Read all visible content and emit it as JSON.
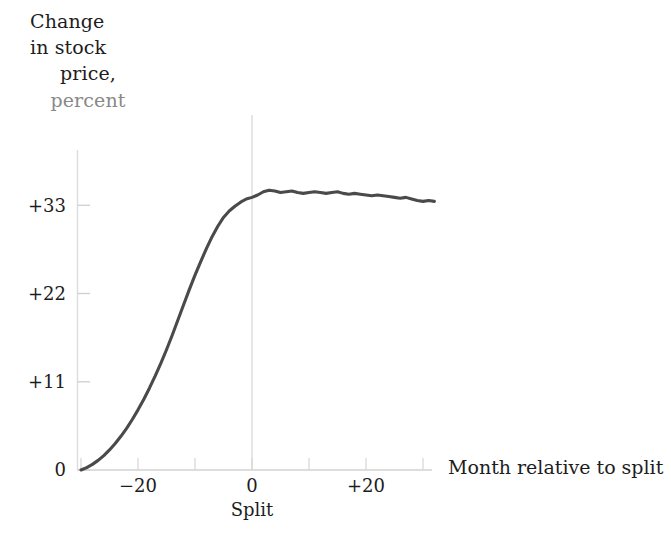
{
  "figure": {
    "name": "stock-split-residual-returns-chart",
    "background_color": "#ffffff",
    "curve_color": "#4a4a4a",
    "axis_color": "#d7d7d7",
    "text_color": "#1d1d1d"
  },
  "y_axis_caption": {
    "line1": "Change",
    "line2": "in stock",
    "line3": "price,",
    "line4": "percent"
  },
  "x_axis_caption": "Month relative to split",
  "split_marker_label": "Split",
  "chart_data": {
    "type": "line",
    "title": "",
    "subtitle": "",
    "xlabel": "Month relative to split",
    "ylabel": "Change in stock price, percent",
    "xlim": [
      -30,
      32
    ],
    "ylim": [
      0,
      38
    ],
    "grid": false,
    "legend": null,
    "annotations": [
      {
        "text": "Split",
        "x": 0,
        "y": 0,
        "type": "vertical-reference-line"
      }
    ],
    "x_ticks": [
      -30,
      -20,
      -10,
      0,
      10,
      20,
      30
    ],
    "x_tick_labels": [
      "",
      "−20",
      "",
      "0",
      "",
      "+20",
      ""
    ],
    "y_ticks": [
      0,
      11,
      22,
      33
    ],
    "y_tick_labels": [
      "0",
      "+11",
      "+22",
      "+33"
    ],
    "series": [
      {
        "name": "Cumulative average residual, percent",
        "x": [
          -30,
          -29,
          -28,
          -27,
          -26,
          -25,
          -24,
          -23,
          -22,
          -21,
          -20,
          -19,
          -18,
          -17,
          -16,
          -15,
          -14,
          -13,
          -12,
          -11,
          -10,
          -9,
          -8,
          -7,
          -6,
          -5,
          -4,
          -3,
          -2,
          -1,
          0,
          1,
          2,
          3,
          4,
          5,
          6,
          7,
          8,
          9,
          10,
          11,
          12,
          13,
          14,
          15,
          16,
          17,
          18,
          19,
          20,
          21,
          22,
          23,
          24,
          25,
          26,
          27,
          28,
          29,
          30,
          31,
          32
        ],
        "values": [
          0.0,
          0.3,
          0.7,
          1.2,
          1.8,
          2.5,
          3.3,
          4.2,
          5.2,
          6.3,
          7.5,
          8.8,
          10.2,
          11.7,
          13.3,
          15.0,
          16.8,
          18.7,
          20.6,
          22.5,
          24.3,
          26.0,
          27.6,
          29.1,
          30.4,
          31.5,
          32.3,
          32.9,
          33.4,
          33.8,
          34.0,
          34.3,
          34.7,
          34.9,
          34.8,
          34.6,
          34.7,
          34.8,
          34.6,
          34.5,
          34.6,
          34.7,
          34.6,
          34.5,
          34.6,
          34.7,
          34.5,
          34.4,
          34.5,
          34.4,
          34.3,
          34.2,
          34.3,
          34.2,
          34.1,
          34.0,
          33.9,
          34.0,
          33.8,
          33.6,
          33.5,
          33.6,
          33.5
        ]
      }
    ]
  }
}
